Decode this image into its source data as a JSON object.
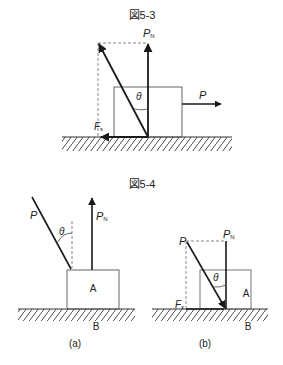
{
  "figure_5_3": {
    "title": "図5-3",
    "labels": {
      "pn_main": "P",
      "pn_sub": "N",
      "theta": "θ",
      "p": "P",
      "fs_main": "F",
      "fs_sub": "s"
    }
  },
  "figure_5_4": {
    "title": "図5-4",
    "panel_a": {
      "caption": "(a)",
      "labels": {
        "p": "P",
        "theta": "θ",
        "pn_main": "P",
        "pn_sub": "N",
        "block": "A",
        "ground": "B"
      }
    },
    "panel_b": {
      "caption": "(b)",
      "labels": {
        "p": "P",
        "pn_main": "P",
        "pn_sub": "N",
        "theta": "θ",
        "fs_main": "F",
        "fs_sub": "s",
        "block": "A",
        "ground": "B"
      }
    }
  },
  "colors": {
    "line": "#1a1a1a",
    "box": "#555555",
    "dash": "#777777",
    "text": "#222222"
  }
}
